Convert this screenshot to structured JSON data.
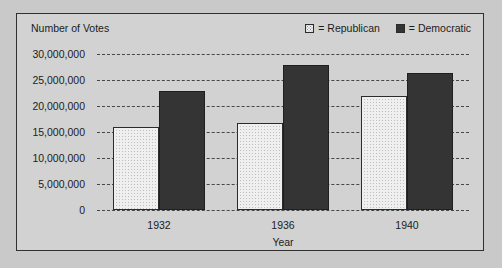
{
  "chart_data": {
    "type": "bar",
    "title": "",
    "xlabel": "Year",
    "ylabel": "Number of Votes",
    "categories": [
      "1932",
      "1936",
      "1940"
    ],
    "series": [
      {
        "name": "Republican",
        "values": [
          16000000,
          16700000,
          22000000
        ],
        "swatch": "stippled-light",
        "color": "#efefef"
      },
      {
        "name": "Democratic",
        "values": [
          22800000,
          27800000,
          26400000
        ],
        "swatch": "solid-dark",
        "color": "#343434"
      }
    ],
    "ylim": [
      0,
      30000000
    ],
    "ytick_values": [
      0,
      5000000,
      10000000,
      15000000,
      20000000,
      25000000,
      30000000
    ],
    "ytick_labels": [
      "0",
      "5,000,000",
      "10,000,000",
      "15,000,000",
      "20,000,000",
      "25,000,000",
      "30,000,000"
    ],
    "grid": true,
    "grid_style": "dotted-horizontal",
    "legend_position": "top-right",
    "legend": [
      {
        "label": "= Republican"
      },
      {
        "label": "= Democratic"
      }
    ]
  },
  "frame": {
    "border_color": "#303030",
    "background": "#d2d2d2"
  }
}
